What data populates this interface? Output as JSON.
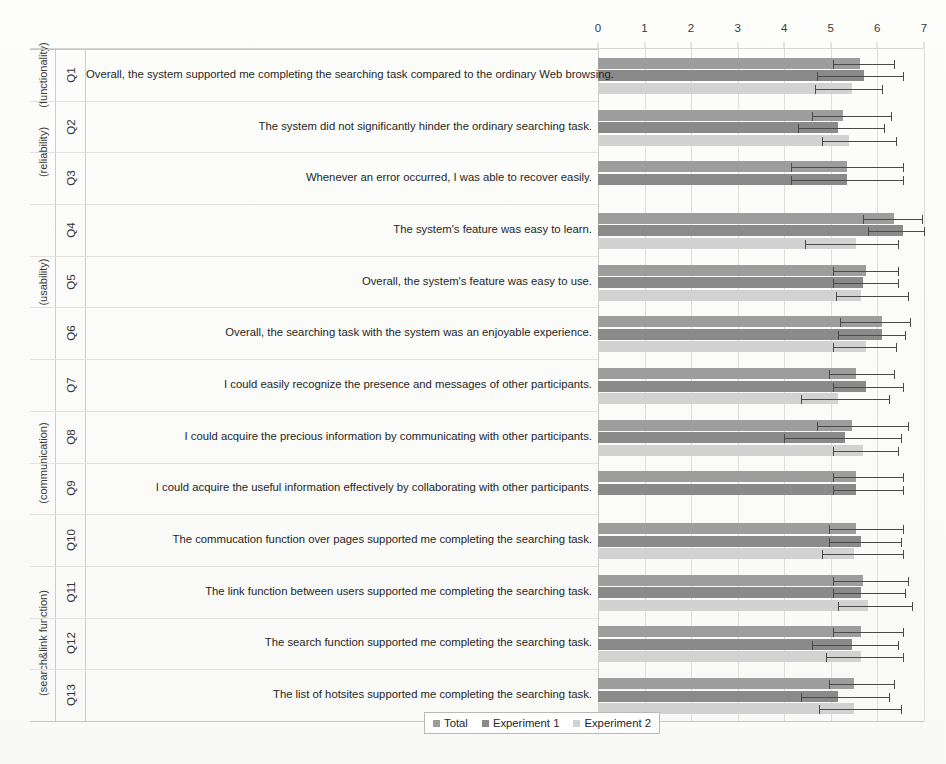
{
  "chart_data": {
    "type": "bar",
    "orientation": "horizontal",
    "title": "",
    "xlabel": "",
    "ylabel": "",
    "xlim": [
      0,
      7
    ],
    "xticks": [
      0,
      1,
      2,
      3,
      4,
      5,
      6,
      7
    ],
    "grid": true,
    "legend_position": "bottom-center",
    "legend": [
      "Total",
      "Experiment 1",
      "Experiment 2"
    ],
    "series": [
      {
        "name": "Total",
        "values": [
          5.62,
          5.25,
          5.35,
          6.35,
          5.75,
          6.1,
          5.55,
          5.45,
          5.55,
          5.55,
          5.7,
          5.65,
          5.5
        ],
        "err_low": [
          5.05,
          4.6,
          4.15,
          5.7,
          5.05,
          5.2,
          4.95,
          4.7,
          5.05,
          4.95,
          5.05,
          5.05,
          4.95
        ],
        "err_high": [
          6.35,
          6.3,
          6.55,
          6.95,
          6.45,
          6.7,
          6.35,
          6.65,
          6.55,
          6.55,
          6.65,
          6.55,
          6.35
        ]
      },
      {
        "name": "Experiment 1",
        "values": [
          5.72,
          5.15,
          5.35,
          6.55,
          5.7,
          6.1,
          5.75,
          5.3,
          5.55,
          5.65,
          5.65,
          5.45,
          5.15
        ],
        "err_low": [
          4.7,
          4.3,
          4.15,
          5.8,
          5.05,
          5.15,
          5.05,
          4.0,
          5.05,
          4.95,
          5.05,
          4.6,
          4.35
        ],
        "err_high": [
          6.55,
          6.15,
          6.55,
          7.0,
          6.45,
          6.6,
          6.55,
          6.5,
          6.55,
          6.5,
          6.6,
          6.45,
          6.25
        ]
      },
      {
        "name": "Experiment 2",
        "values": [
          5.45,
          5.4,
          null,
          5.55,
          5.65,
          5.75,
          5.15,
          5.7,
          null,
          5.5,
          5.8,
          5.65,
          5.5
        ],
        "err_low": [
          4.65,
          4.8,
          null,
          4.45,
          5.1,
          5.05,
          4.35,
          5.05,
          null,
          4.8,
          5.15,
          4.9,
          4.75
        ],
        "err_high": [
          6.1,
          6.4,
          null,
          6.45,
          6.65,
          6.4,
          6.25,
          6.45,
          null,
          6.55,
          6.75,
          6.55,
          6.5
        ]
      }
    ],
    "categories": [
      "Q1",
      "Q2",
      "Q3",
      "Q4",
      "Q5",
      "Q6",
      "Q7",
      "Q8",
      "Q9",
      "Q10",
      "Q11",
      "Q12",
      "Q13"
    ]
  },
  "groups": [
    {
      "label": "(functionality)",
      "questions": [
        0
      ]
    },
    {
      "label": "(reliability)",
      "questions": [
        1,
        2
      ]
    },
    {
      "label": "(usability)",
      "questions": [
        3,
        4,
        5
      ]
    },
    {
      "label": "(communication)",
      "questions": [
        6,
        7,
        8,
        9
      ]
    },
    {
      "label": "(search&link function)",
      "questions": [
        10,
        11,
        12
      ]
    }
  ],
  "questions": [
    {
      "id": "Q1",
      "text": "Overall, the system supported me completing the searching task compared to the ordinary Web browsing."
    },
    {
      "id": "Q2",
      "text": "The system did not significantly hinder the ordinary searching task."
    },
    {
      "id": "Q3",
      "text": "Whenever an error occurred, I was able to recover easily."
    },
    {
      "id": "Q4",
      "text": "The system's feature was easy to learn."
    },
    {
      "id": "Q5",
      "text": "Overall, the system's feature was easy to use."
    },
    {
      "id": "Q6",
      "text": "Overall, the searching task with the system was an enjoyable experience."
    },
    {
      "id": "Q7",
      "text": "I could easily recognize the presence and messages of other participants."
    },
    {
      "id": "Q8",
      "text": "I could acquire the precious information by communicating with other participants."
    },
    {
      "id": "Q9",
      "text": "I could acquire the useful information effectively by collaborating with other participants."
    },
    {
      "id": "Q10",
      "text": "The commucation function over pages supported me completing the searching task."
    },
    {
      "id": "Q11",
      "text": "The link function between users supported me completing the searching task."
    },
    {
      "id": "Q12",
      "text": "The search function supported me completing the searching task."
    },
    {
      "id": "Q13",
      "text": "The list of hotsites supported me completing the searching task."
    }
  ],
  "colors": {
    "total": "#9d9d9d",
    "experiment1": "#8a8a8a",
    "experiment2": "#d2d2d2",
    "error": "#4a4a4a",
    "grid": "#dfdfda"
  }
}
